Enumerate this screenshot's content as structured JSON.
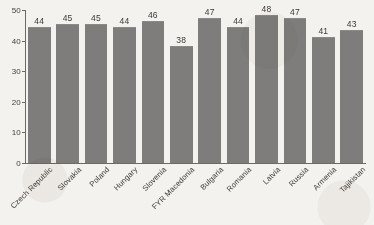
{
  "chart_data": {
    "type": "bar",
    "title": "",
    "subtitle": "",
    "xlabel": "",
    "ylabel": "",
    "ylim": [
      0,
      50
    ],
    "yticks": [
      0,
      10,
      20,
      30,
      40,
      50
    ],
    "grid": false,
    "legend": null,
    "bar_color": "#7e7d7b",
    "background_color": "#f4f2ee",
    "categories": [
      "Czech Republic",
      "Slovakia",
      "Poland",
      "Hungary",
      "Slovenia",
      "FYR Macedonia",
      "Bulgaria",
      "Romania",
      "Latvia",
      "Russia",
      "Armenia",
      "Tajikistan"
    ],
    "values": [
      44,
      45,
      45,
      44,
      46,
      38,
      47,
      44,
      48,
      47,
      41,
      43
    ],
    "data_labels": [
      "44",
      "45",
      "45",
      "44",
      "46",
      "38",
      "47",
      "44",
      "48",
      "47",
      "41",
      "43"
    ],
    "tick_labels": [
      "0",
      "10",
      "20",
      "30",
      "40",
      "50"
    ],
    "notes": {
      "first_category_clipped": "Czech Republic label is clipped at the left image edge, rendering as 'ech Republic'",
      "label_rotation_degrees": -45
    }
  }
}
